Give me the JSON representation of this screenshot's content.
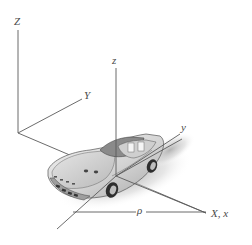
{
  "figure": {
    "labels": {
      "Z_fixed": "Z",
      "Y_fixed": "Y",
      "z_moving": "z",
      "y_moving": "y",
      "rho": "ρ",
      "X_x": "X, x"
    },
    "colors": {
      "axis_line": "#5a5a5a",
      "label": "#4a4a4a",
      "car_body": "#d9d9d9",
      "car_outline": "#555555",
      "shadow": "#bdbdbd",
      "background": "#ffffff"
    }
  }
}
